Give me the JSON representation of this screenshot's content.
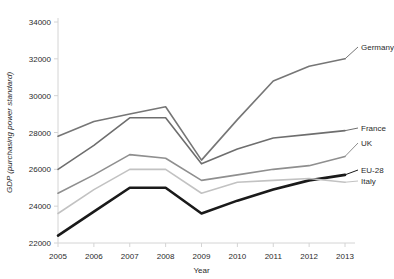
{
  "chart_data": {
    "type": "line",
    "title": "",
    "xlabel": "Year",
    "ylabel": "GDP (purchasing power standard)",
    "x": [
      2005,
      2006,
      2007,
      2008,
      2009,
      2010,
      2011,
      2012,
      2013
    ],
    "xtick_labels": [
      "2005",
      "2006",
      "2007",
      "2008",
      "2009",
      "2010",
      "2011",
      "2012",
      "2013"
    ],
    "ytick_labels": [
      "22000",
      "24000",
      "26000",
      "28000",
      "30000",
      "32000",
      "34000"
    ],
    "yticks": [
      22000,
      24000,
      26000,
      28000,
      30000,
      32000,
      34000
    ],
    "ylim": [
      22000,
      34000
    ],
    "xlim": [
      2005,
      2013
    ],
    "grid": false,
    "legend_position": "right-inline-labels",
    "series": [
      {
        "name": "Germany",
        "color": "#767676",
        "width": 1.6,
        "values": [
          27800,
          28600,
          29000,
          29400,
          26500,
          28700,
          30800,
          31600,
          32000
        ]
      },
      {
        "name": "France",
        "color": "#6e6e6e",
        "width": 1.6,
        "values": [
          26000,
          27300,
          28800,
          28800,
          26300,
          27100,
          27700,
          27900,
          28100
        ]
      },
      {
        "name": "UK",
        "color": "#8f8f8f",
        "width": 1.6,
        "values": [
          24700,
          25700,
          26800,
          26600,
          25400,
          25700,
          26000,
          26200,
          26700
        ]
      },
      {
        "name": "EU-28",
        "color": "#1a1a1a",
        "width": 2.6,
        "values": [
          22400,
          23700,
          25000,
          25000,
          23600,
          24300,
          24900,
          25400,
          25700
        ]
      },
      {
        "name": "Italy",
        "color": "#c2c2c2",
        "width": 1.6,
        "values": [
          23600,
          24900,
          26000,
          26000,
          24700,
          25300,
          25400,
          25500,
          25300
        ]
      }
    ]
  }
}
